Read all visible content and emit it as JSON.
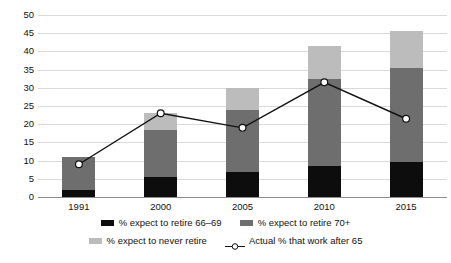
{
  "chart_data": {
    "type": "bar",
    "title": "",
    "subtitle": "",
    "xlabel": "",
    "ylabel": "",
    "categories": [
      "1991",
      "2000",
      "2005",
      "2010",
      "2015"
    ],
    "ylim": [
      0,
      50
    ],
    "ytick_step": 5,
    "ytick_labels": [
      "0",
      "5",
      "10",
      "15",
      "20",
      "25",
      "30",
      "35",
      "40",
      "45",
      "50"
    ],
    "grid": true,
    "stacked": true,
    "legend_position": "bottom",
    "series": [
      {
        "name": "% expect to retire 66–69",
        "kind": "bar",
        "color": "#0d0d0d",
        "values": [
          2,
          5.5,
          7,
          8.5,
          9.5
        ]
      },
      {
        "name": "% expect to retire 70+",
        "kind": "bar",
        "color": "#6e6e6e",
        "values": [
          9,
          13,
          17,
          24,
          26
        ]
      },
      {
        "name": "% expect to never retire",
        "kind": "bar",
        "color": "#bcbcbc",
        "values": [
          0,
          4.5,
          6,
          9,
          10
        ]
      },
      {
        "name": "Actual % that work after 65",
        "kind": "line",
        "color": "#111111",
        "marker": "open-circle",
        "values": [
          9,
          23,
          19,
          31.5,
          21.5
        ]
      }
    ],
    "stack_totals": [
      11,
      23,
      30,
      41.5,
      45.5
    ]
  },
  "legend": {
    "items": [
      {
        "label": "% expect to retire 66–69",
        "swatch": "black-swatch"
      },
      {
        "label": "% expect to retire 70+",
        "swatch": "dark-gray-swatch"
      },
      {
        "label": "% expect to never retire",
        "swatch": "light-gray-swatch"
      },
      {
        "label": "Actual % that work after 65",
        "swatch": "open-circle-line-marker"
      }
    ]
  },
  "colors": {
    "series_a": "#0d0d0d",
    "series_b": "#6e6e6e",
    "series_c": "#bcbcbc",
    "line": "#111111",
    "gridline": "#d9d9d9",
    "axis": "#8c8c8c",
    "background": "#ffffff"
  }
}
